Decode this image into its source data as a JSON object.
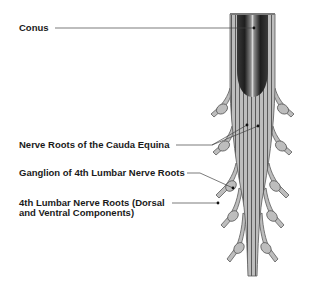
{
  "diagram": {
    "type": "anatomical-illustration",
    "labels": [
      {
        "id": "conus",
        "text": "Conus"
      },
      {
        "id": "nerve-roots",
        "text": "Nerve Roots of the Cauda Equina"
      },
      {
        "id": "ganglion",
        "text": "Ganglion of 4th Lumbar Nerve Roots"
      },
      {
        "id": "lumbar-roots-line1",
        "text": "4th Lumbar Nerve Roots (Dorsal"
      },
      {
        "id": "lumbar-roots-line2",
        "text": "and Ventral Components)"
      }
    ],
    "colors": {
      "root_fill": "#b8b8b8",
      "root_stripe": "#555555",
      "conus_dark": "#2a2a2a",
      "conus_highlight": "#d0d0d0",
      "ganglion_fill": "#bdbdbd",
      "leader_line": "#444444",
      "text": "#1a1a1a"
    }
  }
}
